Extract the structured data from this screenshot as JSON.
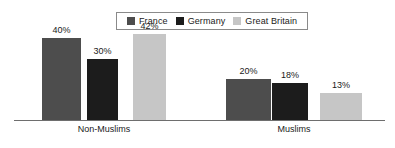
{
  "chart_data": {
    "type": "bar",
    "title": "",
    "subtitle": "",
    "xlabel": "",
    "ylabel": "",
    "ylim": [
      0,
      45
    ],
    "grid": false,
    "legend_position": "top-center",
    "categories": [
      "Non-Muslims",
      "Muslims"
    ],
    "series": [
      {
        "name": "France",
        "color": "#4d4d4d",
        "values": [
          40,
          20
        ],
        "labels": [
          "40%",
          "20%"
        ]
      },
      {
        "name": "Germany",
        "color": "#1c1c1c",
        "values": [
          30,
          18
        ],
        "labels": [
          "30%",
          "18%"
        ]
      },
      {
        "name": "Great Britain",
        "color": "#c6c6c6",
        "values": [
          42,
          13
        ],
        "labels": [
          "42%",
          "13%"
        ]
      }
    ],
    "value_suffix": "%"
  },
  "legend": {
    "entries": [
      {
        "label": "France"
      },
      {
        "label": "Germany"
      },
      {
        "label": "Great Britain"
      }
    ]
  },
  "axis": {
    "categories": [
      {
        "label": "Non-Muslims"
      },
      {
        "label": "Muslims"
      }
    ]
  },
  "colors": {
    "france": "#4d4d4d",
    "germany": "#1c1c1c",
    "great_britain": "#c6c6c6",
    "baseline": "#6e6e6e",
    "legend_border": "#8a8a8a",
    "text": "#1a1a1a",
    "background": "#ffffff"
  }
}
